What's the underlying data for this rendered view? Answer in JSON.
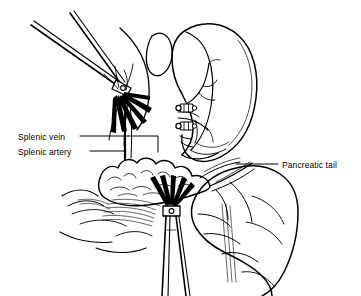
{
  "figure": {
    "background_color": "#ffffff",
    "ink_color": "#000000",
    "width": 361,
    "height": 296
  },
  "labels": [
    {
      "id": "splenic_vein",
      "text": "Splenic vein",
      "x": 18,
      "y": 132,
      "leader": "horizontal-right-then-down"
    },
    {
      "id": "splenic_artery",
      "text": "Splenic artery",
      "x": 18,
      "y": 147,
      "leader": "horizontal-right-then-down"
    },
    {
      "id": "pancreatic_tail",
      "text": "Pancreatic tail",
      "x": 282,
      "y": 160,
      "leader": "horizontal-left"
    }
  ],
  "structures": [
    {
      "id": "spleen",
      "name": "spleen",
      "description": "comma-shaped organ upper right with hilar vessel branches"
    },
    {
      "id": "pancreas",
      "name": "pancreas",
      "description": "lobulated gland across the middle, tail directed to the right"
    },
    {
      "id": "stomach_colon",
      "name": "stomach and colon",
      "description": "lobulated viscera lower right"
    },
    {
      "id": "vessel_branches",
      "name": "splenic vessel branches",
      "description": "arterial and venous branches entering splenic hilum"
    },
    {
      "id": "hatching",
      "name": "shading hatching",
      "description": "fine parallel shading lines on retroperitoneal tissue"
    }
  ],
  "instruments": [
    {
      "id": "upper_clamp",
      "name": "upper surgical forceps",
      "description": "forceps at upper left grasping the splenic vessels, handles exiting top-left"
    },
    {
      "id": "lower_clamp",
      "name": "lower surgical forceps",
      "description": "forceps at lower middle grasping tissue, shaft exiting bottom"
    },
    {
      "id": "clips",
      "name": "surgical ligating clips",
      "count": 2,
      "description": "two metal clips applied to vessels at the splenic hilum"
    }
  ],
  "colors": {
    "ink": "#000000",
    "background": "#ffffff",
    "clip_fill": "#ffffff",
    "jaw_fill": "#000000"
  }
}
